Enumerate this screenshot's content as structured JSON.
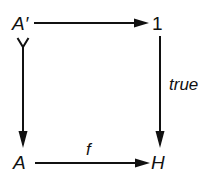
{
  "diagram": {
    "type": "commutative-square",
    "nodes": {
      "top_left": "A′",
      "top_right": "1",
      "bottom_left": "A",
      "bottom_right": "H"
    },
    "edges": [
      {
        "from": "top_left",
        "to": "top_right",
        "label": "",
        "style": "arrow"
      },
      {
        "from": "top_left",
        "to": "bottom_left",
        "label": "",
        "style": "mono-arrow"
      },
      {
        "from": "top_right",
        "to": "bottom_right",
        "label": "true",
        "style": "arrow"
      },
      {
        "from": "bottom_left",
        "to": "bottom_right",
        "label": "f",
        "style": "arrow"
      }
    ],
    "labels": {
      "right_edge": "true",
      "bottom_edge": "f"
    },
    "colors": {
      "ink": "#111111",
      "background": "#ffffff"
    }
  }
}
